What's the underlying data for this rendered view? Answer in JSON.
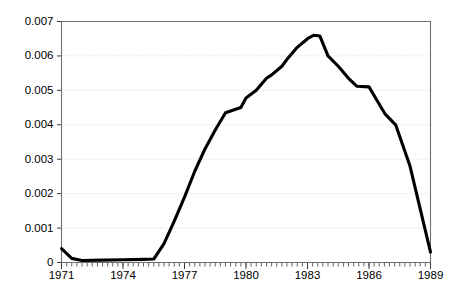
{
  "chart_data": {
    "type": "line",
    "title": "",
    "subtitle": "",
    "xlabel": "",
    "ylabel": "",
    "xlim": [
      1971,
      1989
    ],
    "ylim": [
      0,
      0.007
    ],
    "grid": true,
    "legend": false,
    "y_ticks": [
      0,
      0.001,
      0.002,
      0.003,
      0.004,
      0.005,
      0.006,
      0.007
    ],
    "y_tick_labels": [
      "0",
      "0.001",
      "0.002",
      "0.003",
      "0.004",
      "0.005",
      "0.006",
      "0.007"
    ],
    "x_ticks": [
      1971,
      1974,
      1977,
      1980,
      1983,
      1986,
      1989
    ],
    "x_tick_labels": [
      "1971",
      "1974",
      "1977",
      "1980",
      "1983",
      "1986",
      "1989"
    ],
    "x_minor_tick_interval": 0.25,
    "line_color": "#000000",
    "line_width": 3.1,
    "series": [
      {
        "name": "series-1",
        "x": [
          1971.0,
          1971.5,
          1972.0,
          1973.0,
          1974.0,
          1975.0,
          1975.5,
          1976.0,
          1976.5,
          1977.0,
          1977.5,
          1978.0,
          1978.5,
          1979.0,
          1979.25,
          1979.75,
          1980.0,
          1980.5,
          1981.0,
          1981.25,
          1981.75,
          1982.0,
          1982.5,
          1983.0,
          1983.3,
          1983.6,
          1984.0,
          1984.5,
          1985.0,
          1985.4,
          1986.0,
          1986.4,
          1986.8,
          1987.3,
          1988.0,
          1989.0
        ],
        "y": [
          0.0004,
          0.00012,
          6e-05,
          7e-05,
          8e-05,
          9e-05,
          0.0001,
          0.00055,
          0.0012,
          0.0019,
          0.00265,
          0.0033,
          0.00385,
          0.00435,
          0.0044,
          0.0045,
          0.00478,
          0.005,
          0.00535,
          0.00545,
          0.0057,
          0.0059,
          0.00625,
          0.0065,
          0.0066,
          0.00658,
          0.006,
          0.0057,
          0.00535,
          0.00512,
          0.0051,
          0.0047,
          0.0043,
          0.004,
          0.0028,
          0.0003
        ]
      }
    ]
  },
  "axes": {
    "y_axis_name": "value-axis",
    "x_axis_name": "year-axis"
  }
}
